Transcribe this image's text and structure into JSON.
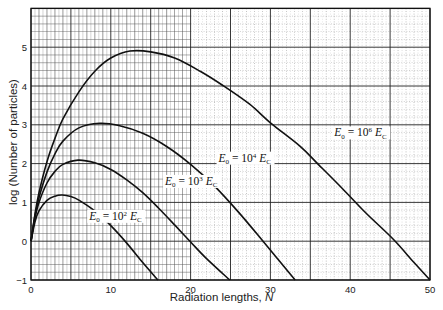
{
  "chart_data": {
    "type": "line",
    "title": "",
    "xlabel": "Radiation lengths, N",
    "xlabel_text": "Radiation lengths, ",
    "xlabel_var": "N",
    "ylabel": "log (Number of particles)",
    "xlim": [
      0,
      50
    ],
    "ylim": [
      -1,
      6
    ],
    "xticks": [
      0,
      10,
      20,
      30,
      40,
      50
    ],
    "yticks": [
      -1,
      0,
      1,
      2,
      3,
      4,
      5
    ],
    "grid": true,
    "legend": "inline labels",
    "series": [
      {
        "name": "E0 = 10^2 Ec",
        "label_base": "10",
        "label_exp": "2",
        "label_pos": [
          7.3,
          0.55
        ],
        "x": [
          0,
          0.5,
          1,
          2,
          3,
          3.9,
          5,
          6,
          8,
          10,
          12,
          14,
          15.9
        ],
        "y": [
          0,
          0.5,
          0.78,
          1.05,
          1.16,
          1.19,
          1.15,
          1.06,
          0.78,
          0.4,
          -0.05,
          -0.55,
          -1.0
        ]
      },
      {
        "name": "E0 = 10^3 Ec",
        "label_base": "10",
        "label_exp": "3",
        "label_pos": [
          16.8,
          1.45
        ],
        "x": [
          0,
          0.5,
          1,
          2,
          3,
          4,
          5.9,
          8,
          10,
          12,
          14,
          16,
          18,
          20,
          22,
          24.9
        ],
        "y": [
          0,
          0.6,
          1.0,
          1.5,
          1.8,
          1.98,
          2.09,
          2.02,
          1.85,
          1.58,
          1.25,
          0.85,
          0.42,
          -0.02,
          -0.45,
          -1.0
        ]
      },
      {
        "name": "E0 = 10^4 Ec",
        "label_base": "10",
        "label_exp": "4",
        "label_pos": [
          23.5,
          2.05
        ],
        "x": [
          0,
          0.5,
          1,
          2,
          3,
          4,
          6,
          8.6,
          11,
          14,
          17,
          20,
          23,
          26,
          29,
          31,
          33.1
        ],
        "y": [
          0,
          0.65,
          1.12,
          1.78,
          2.25,
          2.58,
          2.92,
          3.04,
          2.98,
          2.78,
          2.44,
          1.98,
          1.42,
          0.75,
          0.02,
          -0.48,
          -1.0
        ]
      },
      {
        "name": "E0 = 10^6 Ec",
        "label_base": "10",
        "label_exp": "6",
        "label_pos": [
          38.0,
          2.7
        ],
        "x": [
          0,
          0.5,
          1,
          2,
          3,
          4,
          6,
          8,
          10,
          12.4,
          15,
          18,
          21.2,
          24,
          27.4,
          30,
          33.7,
          36,
          39.1,
          42,
          45.4,
          48,
          50
        ],
        "y": [
          0,
          0.7,
          1.25,
          2.05,
          2.65,
          3.15,
          3.85,
          4.38,
          4.72,
          4.9,
          4.88,
          4.72,
          4.38,
          4.02,
          3.53,
          3.05,
          2.45,
          1.98,
          1.34,
          0.72,
          0.05,
          -0.55,
          -1.0
        ]
      }
    ]
  }
}
